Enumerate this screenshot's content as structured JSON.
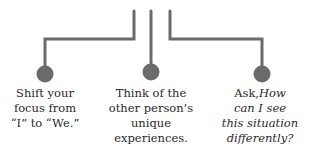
{
  "diagram": {
    "connector_color": "#6b6b6b",
    "items": [
      {
        "lines": [
          "Shift your",
          "focus from",
          "“I” to “We.”"
        ]
      },
      {
        "lines": [
          "Think of the",
          "other person’s",
          "unique",
          "experiences."
        ]
      },
      {
        "prefix": "Ask,",
        "italic_first": "How",
        "italic_lines": [
          "can I see",
          "this situation",
          "differently?"
        ]
      }
    ]
  }
}
